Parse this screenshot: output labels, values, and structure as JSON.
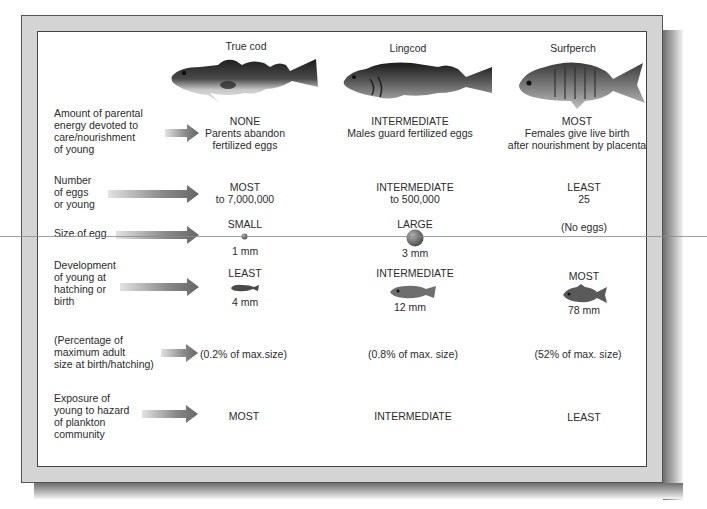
{
  "species": [
    {
      "name": "True cod"
    },
    {
      "name": "Lingcod"
    },
    {
      "name": "Surfperch"
    }
  ],
  "rows": [
    {
      "label": [
        "Amount of parental",
        "energy devoted to",
        "care/nourishment",
        "of young"
      ],
      "values": [
        [
          "NONE",
          "Parents abandon",
          "fertilized eggs"
        ],
        [
          "INTERMEDIATE",
          "Males guard fertilized eggs"
        ],
        [
          "MOST",
          "Females give live birth",
          "after nourishment by placenta"
        ]
      ]
    },
    {
      "label": [
        "Number",
        "of eggs",
        "or young"
      ],
      "values": [
        [
          "MOST",
          "to 7,000,000"
        ],
        [
          "INTERMEDIATE",
          "to 500,000"
        ],
        [
          "LEAST",
          "25"
        ]
      ]
    },
    {
      "label": [
        "Size of egg"
      ],
      "values": [
        [
          "SMALL",
          "1 mm"
        ],
        [
          "LARGE",
          "3 mm"
        ],
        [
          "(No eggs)"
        ]
      ]
    },
    {
      "label": [
        "Development",
        "of young at",
        "hatching or",
        "birth"
      ],
      "values": [
        [
          "LEAST",
          "4 mm"
        ],
        [
          "INTERMEDIATE",
          "12 mm"
        ],
        [
          "MOST",
          "78 mm"
        ]
      ]
    },
    {
      "label": [
        "(Percentage of",
        "maximum adult",
        "size at birth/hatching)"
      ],
      "values": [
        [
          "(0.2% of max.size)"
        ],
        [
          "(0.8% of max. size)"
        ],
        [
          "(52% of max. size)"
        ]
      ]
    },
    {
      "label": [
        "Exposure of",
        "young to hazard",
        "of plankton",
        "community"
      ],
      "values": [
        [
          "MOST"
        ],
        [
          "INTERMEDIATE"
        ],
        [
          "LEAST"
        ]
      ]
    }
  ],
  "icons": {
    "arrow": "right-arrow-icon",
    "fish_adult": "fish-icon",
    "egg": "egg-icon",
    "larva": "larva-icon"
  },
  "colors": {
    "frame": "#d4d4d4",
    "panel": "#ffffff",
    "text": "#2b2b2b",
    "arrow_dark": "#6a6a6a",
    "arrow_light": "#d8d8d8"
  }
}
